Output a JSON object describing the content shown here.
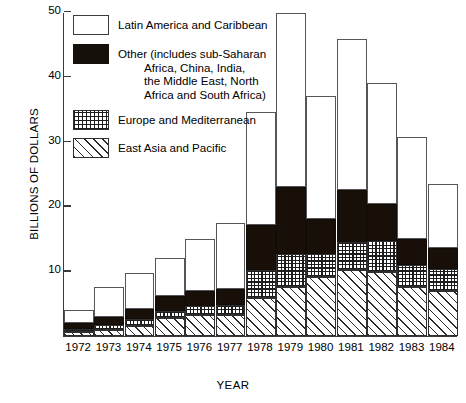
{
  "chart_data": {
    "type": "bar",
    "stacked": true,
    "title": "",
    "xlabel": "YEAR",
    "ylabel": "BILLIONS OF DOLLARS",
    "categories": [
      "1972",
      "1973",
      "1974",
      "1975",
      "1976",
      "1977",
      "1978",
      "1979",
      "1980",
      "1981",
      "1982",
      "1983",
      "1984"
    ],
    "ylim": [
      0,
      50
    ],
    "yticks": [
      10,
      20,
      30,
      40,
      50
    ],
    "ytick_labels": [
      "10",
      "20",
      "30",
      "40",
      "50"
    ],
    "grid": false,
    "legend_position": "upper-left-inside",
    "series": [
      {
        "name": "East Asia and Pacific",
        "pattern": "diagonal-hatch",
        "values": [
          0.6,
          1.0,
          1.6,
          2.8,
          3.2,
          3.3,
          5.8,
          7.6,
          9.1,
          10.2,
          9.9,
          7.6,
          7.0
        ]
      },
      {
        "name": "Europe and Mediterranean",
        "pattern": "cross-hatch-dots",
        "values": [
          0.5,
          0.7,
          1.0,
          1.1,
          1.5,
          1.5,
          4.4,
          5.0,
          3.6,
          4.3,
          4.8,
          3.3,
          3.3
        ]
      },
      {
        "name": "Other (includes sub-Saharan Africa, China, India, the Middle East, North Africa and South Africa)",
        "pattern": "solid-black",
        "values": [
          0.9,
          1.3,
          1.6,
          2.2,
          2.2,
          2.5,
          7.0,
          10.4,
          5.4,
          8.0,
          5.6,
          4.1,
          3.3
        ]
      },
      {
        "name": "Latin America and Caribbean",
        "pattern": "white",
        "values": [
          2.0,
          4.5,
          5.6,
          5.9,
          8.1,
          10.1,
          17.3,
          26.8,
          18.9,
          23.3,
          18.7,
          15.7,
          9.9
        ]
      }
    ],
    "totals": [
      4.0,
      7.5,
      9.8,
      12.0,
      15.0,
      17.4,
      34.5,
      49.8,
      37.0,
      45.8,
      39.0,
      30.7,
      23.5
    ]
  },
  "axes": {
    "y_title": "BILLIONS OF DOLLARS",
    "x_title": "YEAR"
  },
  "legend": {
    "items": [
      {
        "key": "latin",
        "label": "Latin America and Caribbean",
        "continuation": ""
      },
      {
        "key": "other",
        "label": "Other (includes sub-Saharan",
        "line2": "Africa, China, India,",
        "line3": "the Middle East, North",
        "line4": "Africa and South Africa)"
      },
      {
        "key": "europe",
        "label": "Europe and Mediterranean",
        "continuation": ""
      },
      {
        "key": "eastasia",
        "label": "East Asia and Pacific",
        "continuation": ""
      }
    ]
  },
  "colors": {
    "axis": "#3a3a3a",
    "other_fill": "#181008",
    "latin_fill": "#ffffff",
    "hatch": "#2a2a2a",
    "background": "#ffffff"
  }
}
